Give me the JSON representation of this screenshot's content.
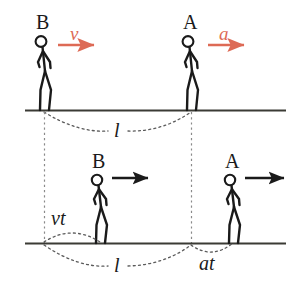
{
  "figure": {
    "width": 299,
    "height": 298,
    "background": "#ffffff"
  },
  "colors": {
    "ink": "#1a1a1a",
    "ground": "#3b3b35",
    "accent_red": "#dd6a55",
    "dotted": "#5a5a5a",
    "dashed": "#8a8a8a"
  },
  "scenes": [
    {
      "id": "top-scene",
      "name": "initial-configuration",
      "ground_y": 110,
      "figures": [
        {
          "id": "top-B",
          "label": "B",
          "label_x": 36,
          "label_y": 12,
          "feet_x": 44,
          "arrow": {
            "label": "v",
            "label_x": 70,
            "label_y": 26,
            "color": "#dd6a55",
            "x1": 58,
            "x2": 99,
            "y": 45
          }
        },
        {
          "id": "top-A",
          "label": "A",
          "label_x": 183,
          "label_y": 12,
          "feet_x": 191,
          "arrow": {
            "label": "a",
            "label_x": 218,
            "label_y": 26,
            "color": "#dd6a55",
            "x1": 208,
            "x2": 249,
            "y": 45
          }
        }
      ],
      "measures": [
        {
          "id": "top-l",
          "label": "l",
          "label_x": 118,
          "label_y": 124,
          "from_x": 44,
          "to_x": 191,
          "arc_depth": 22,
          "style": "dotted"
        }
      ]
    },
    {
      "id": "bottom-scene",
      "name": "configuration-after-time-t",
      "ground_y": 243,
      "figures": [
        {
          "id": "bottom-B",
          "label": "B",
          "label_x": 95,
          "label_y": 152,
          "feet_x": 100,
          "arrow": {
            "label": "",
            "color": "#1a1a1a",
            "x1": 112,
            "x2": 153,
            "y": 178
          }
        },
        {
          "id": "bottom-A",
          "label": "A",
          "label_x": 228,
          "label_y": 152,
          "feet_x": 233,
          "arrow": {
            "label": "",
            "color": "#1a1a1a",
            "x1": 245,
            "x2": 288,
            "y": 178
          }
        }
      ],
      "measures": [
        {
          "id": "bottom-vt",
          "label": "vt",
          "label_x": 58,
          "label_y": 210,
          "from_x": 44,
          "to_x": 100,
          "arc_depth": -14,
          "style": "dotted"
        },
        {
          "id": "bottom-l",
          "label": "l",
          "label_x": 118,
          "label_y": 258,
          "from_x": 44,
          "to_x": 191,
          "arc_depth": 25,
          "style": "dotted"
        },
        {
          "id": "bottom-at",
          "label": "at",
          "label_x": 204,
          "label_y": 257,
          "from_x": 191,
          "to_x": 233,
          "arc_depth": 14,
          "style": "dotted"
        }
      ]
    }
  ],
  "connectors": [
    {
      "id": "connector-left",
      "name": "projection-line-B",
      "x": 44,
      "y1": 112,
      "y2": 245,
      "style": "dashed"
    },
    {
      "id": "connector-right",
      "name": "projection-line-A",
      "x": 191,
      "y1": 112,
      "y2": 245,
      "style": "dashed"
    }
  ],
  "labels": {
    "top_b": "B",
    "top_a": "A",
    "top_v": "v",
    "top_a_accel": "a",
    "top_l": "l",
    "bottom_b": "B",
    "bottom_a": "A",
    "bottom_vt": "vt",
    "bottom_l": "l",
    "bottom_at": "at"
  }
}
